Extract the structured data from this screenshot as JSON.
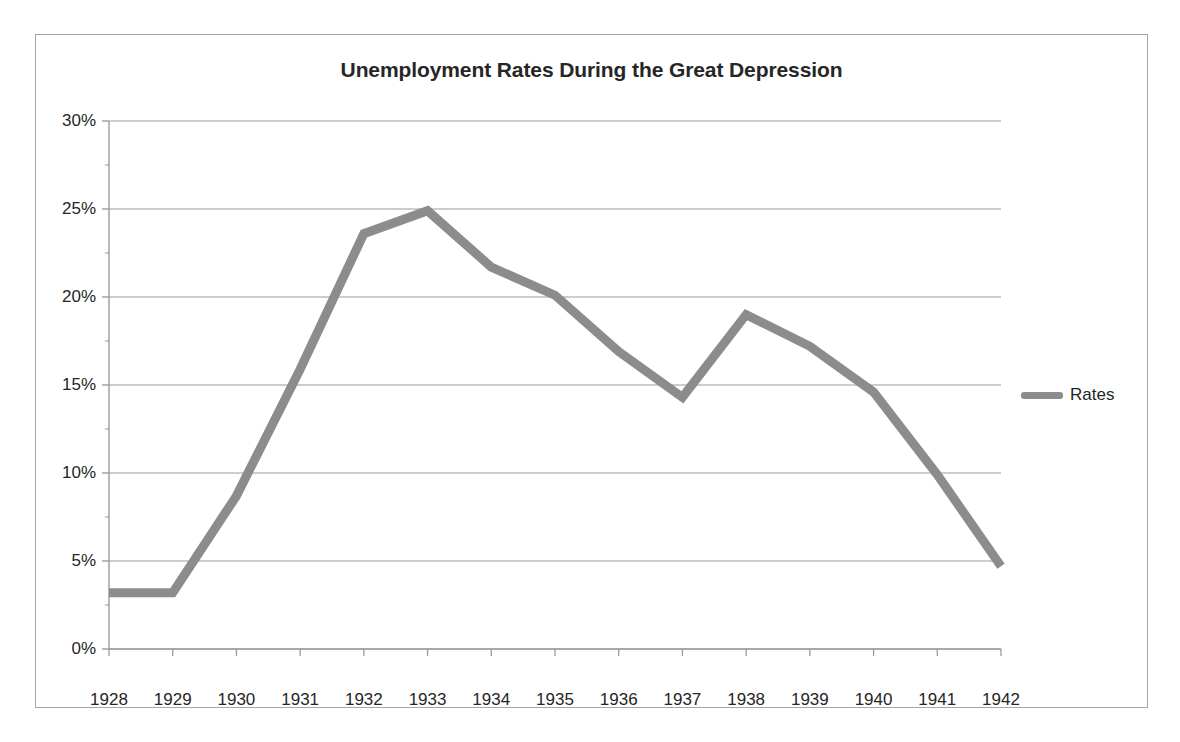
{
  "chart_data": {
    "type": "line",
    "title": "Unemployment Rates During the Great Depression",
    "xlabel": "",
    "ylabel": "",
    "categories": [
      "1928",
      "1929",
      "1930",
      "1931",
      "1932",
      "1933",
      "1934",
      "1935",
      "1936",
      "1937",
      "1938",
      "1939",
      "1940",
      "1941",
      "1942"
    ],
    "series": [
      {
        "name": "Rates",
        "color": "#8c8c8c",
        "values": [
          3.2,
          3.2,
          8.7,
          15.9,
          23.6,
          24.9,
          21.7,
          20.1,
          16.9,
          14.3,
          19.0,
          17.2,
          14.6,
          9.9,
          4.7
        ]
      }
    ],
    "value_suffix": "%",
    "ylim": [
      0,
      30
    ],
    "y_ticks": [
      0,
      5,
      10,
      15,
      20,
      25,
      30
    ],
    "y_tick_labels": [
      "0%",
      "5%",
      "10%",
      "15%",
      "20%",
      "25%",
      "30%"
    ],
    "y_minor_step": 2.5,
    "grid": "horizontal-major",
    "legend_position": "right",
    "legend_entries": [
      "Rates"
    ]
  },
  "colors": {
    "line": "#8c8c8c",
    "gridline": "#9c9c9c",
    "axis": "#9c9c9c",
    "frame_border": "#a6a6a6",
    "text": "#262626",
    "background": "#ffffff"
  }
}
